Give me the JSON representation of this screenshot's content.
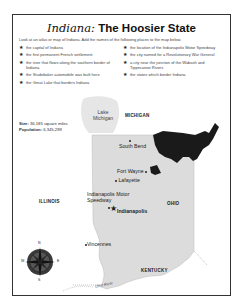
{
  "title": {
    "italic_part": "Indiana:",
    "rest": " The Hoosier State"
  },
  "intro": "Look at an atlas or map of Indiana. Add the names of the following places to the map below.",
  "tasks_left": [
    "the capital of Indiana",
    "the first permanent French settlement",
    "the river that flows along the southern border of Indiana",
    "the Studebaker automobile was built here",
    "the Great Lake that borders Indiana"
  ],
  "tasks_right": [
    "the location of the Indianapolis Motor Speedway",
    "the city named for a Revolutionary War General",
    "a city near the junction of the Wabash and Tippecanoe Rivers",
    "the states which border Indiana"
  ],
  "facts": {
    "size_label": "Size:",
    "size_value": "36,185 square miles",
    "population_label": "Population:",
    "population_value": "6,345,289"
  },
  "map": {
    "lake": "Lake Michigan",
    "states": {
      "michigan": "MICHIGAN",
      "illinois": "ILLINOIS",
      "ohio": "OHIO",
      "kentucky": "KENTUCKY"
    },
    "cities": {
      "south_bend": "South Bend",
      "fort_wayne": "Fort Wayne",
      "lafayette": "Lafayette",
      "speedway": "Indianapolis Motor Speedway",
      "indianapolis": "Indianapolis",
      "vincennes": "Vincennes"
    },
    "river": "Ohio River",
    "compass": {
      "n": "N",
      "s": "S",
      "e": "E",
      "w": "W"
    },
    "colors": {
      "indiana_fill": "#dcdcdc",
      "lake_fill": "#e6e6e6",
      "us_map": "#1a1a1a"
    }
  }
}
